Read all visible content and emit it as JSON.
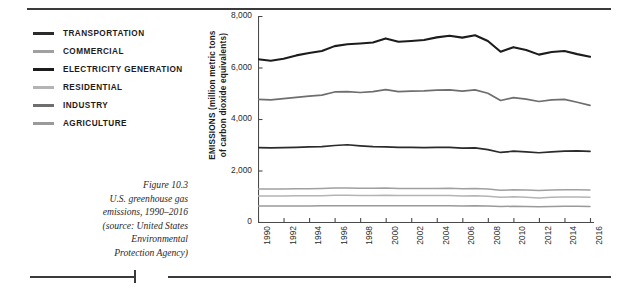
{
  "legend": {
    "items": [
      {
        "label": "TRANSPORTATION",
        "color": "#2b2b2b"
      },
      {
        "label": "COMMERCIAL",
        "color": "#a0a0a0"
      },
      {
        "label": "ELECTRICITY GENERATION",
        "color": "#1c1c1c"
      },
      {
        "label": "RESIDENTIAL",
        "color": "#b4b4b4"
      },
      {
        "label": "INDUSTRY",
        "color": "#6e6e6e"
      },
      {
        "label": "AGRICULTURE",
        "color": "#9a9a9a"
      }
    ]
  },
  "caption": {
    "lines": [
      "Figure 10.3",
      "U.S. greenhouse gas",
      "emissions, 1990–2016",
      "(source: United States",
      "Environmental",
      "Protection Agency)"
    ]
  },
  "chart_data": {
    "type": "line",
    "title": "",
    "xlabel": "",
    "ylabel": "EMISSIONS (million metric tons of carbon dioxide equivalents)",
    "ylabel_line1": "EMISSIONS (million metric tons",
    "ylabel_line2": "of carbon dioxide equivalents)",
    "grid": false,
    "legend_position": "left-outside",
    "xlim": [
      1990,
      2016
    ],
    "ylim": [
      0,
      8000
    ],
    "ytick_labels": [
      "8,000",
      "6,000",
      "4,000",
      "2,000",
      "0"
    ],
    "yticks": [
      8000,
      6000,
      4000,
      2000,
      0
    ],
    "xtick_labels": [
      "1990",
      "1992",
      "1994",
      "1996",
      "1998",
      "2000",
      "2002",
      "2004",
      "2006",
      "2008",
      "2010",
      "2012",
      "2014",
      "2016"
    ],
    "xticks": [
      1990,
      1992,
      1994,
      1996,
      1998,
      2000,
      2002,
      2004,
      2006,
      2008,
      2010,
      2012,
      2014,
      2016
    ],
    "x": [
      1990,
      1991,
      1992,
      1993,
      1994,
      1995,
      1996,
      1997,
      1998,
      1999,
      2000,
      2001,
      2002,
      2003,
      2004,
      2005,
      2006,
      2007,
      2008,
      2009,
      2010,
      2011,
      2012,
      2013,
      2014,
      2015,
      2016
    ],
    "series": [
      {
        "name": "ELECTRICITY GENERATION",
        "color": "#1c1c1c",
        "width": 2.1,
        "values": [
          6320,
          6260,
          6340,
          6470,
          6560,
          6640,
          6830,
          6900,
          6930,
          6970,
          7130,
          7000,
          7030,
          7070,
          7170,
          7230,
          7160,
          7250,
          7030,
          6610,
          6790,
          6680,
          6500,
          6600,
          6640,
          6520,
          6420
        ]
      },
      {
        "name": "INDUSTRY",
        "color": "#6e6e6e",
        "width": 1.7,
        "values": [
          4760,
          4740,
          4790,
          4840,
          4890,
          4930,
          5050,
          5060,
          5030,
          5060,
          5140,
          5060,
          5080,
          5090,
          5120,
          5130,
          5080,
          5130,
          5000,
          4720,
          4830,
          4770,
          4680,
          4740,
          4760,
          4650,
          4530
        ]
      },
      {
        "name": "TRANSPORTATION",
        "color": "#2b2b2b",
        "width": 1.7,
        "values": [
          2890,
          2880,
          2890,
          2900,
          2920,
          2930,
          2970,
          3000,
          2960,
          2930,
          2920,
          2900,
          2900,
          2890,
          2900,
          2900,
          2870,
          2880,
          2810,
          2700,
          2750,
          2720,
          2690,
          2720,
          2750,
          2760,
          2740
        ]
      },
      {
        "name": "COMMERCIAL",
        "color": "#a0a0a0",
        "width": 1.5,
        "values": [
          1280,
          1280,
          1280,
          1290,
          1290,
          1300,
          1320,
          1320,
          1310,
          1310,
          1320,
          1300,
          1300,
          1300,
          1300,
          1310,
          1290,
          1300,
          1280,
          1230,
          1250,
          1240,
          1220,
          1240,
          1250,
          1250,
          1240
        ]
      },
      {
        "name": "RESIDENTIAL",
        "color": "#b4b4b4",
        "width": 1.5,
        "values": [
          1010,
          1010,
          1010,
          1020,
          1020,
          1020,
          1040,
          1040,
          1030,
          1030,
          1040,
          1030,
          1030,
          1030,
          1030,
          1030,
          1010,
          1020,
          1000,
          960,
          980,
          960,
          930,
          960,
          970,
          970,
          960
        ]
      },
      {
        "name": "AGRICULTURE",
        "color": "#9a9a9a",
        "width": 1.5,
        "values": [
          620,
          620,
          620,
          625,
          625,
          630,
          635,
          635,
          630,
          630,
          635,
          630,
          630,
          630,
          630,
          630,
          625,
          630,
          620,
          600,
          610,
          605,
          595,
          605,
          610,
          610,
          605
        ]
      }
    ]
  }
}
